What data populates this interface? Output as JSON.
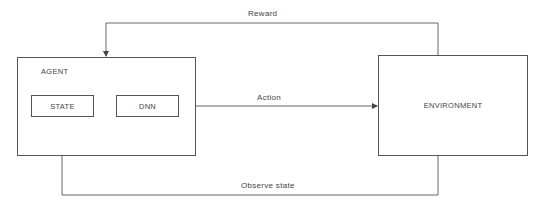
{
  "diagram": {
    "nodes": {
      "agent": {
        "label": "AGENT"
      },
      "state": {
        "label": "STATE"
      },
      "dnn": {
        "label": "DNN"
      },
      "environment": {
        "label": "ENVIRONMENT"
      }
    },
    "edges": {
      "reward": {
        "label": "Reward",
        "from": "ENVIRONMENT",
        "to": "AGENT"
      },
      "action": {
        "label": "Action",
        "from": "AGENT",
        "to": "ENVIRONMENT"
      },
      "observe": {
        "label": "Observe state",
        "from": "ENVIRONMENT",
        "to": "STATE"
      },
      "state_to_dnn": {
        "label": "",
        "from": "STATE",
        "to": "DNN"
      }
    },
    "colors": {
      "line": "#555555",
      "text": "#444444",
      "background": "#ffffff"
    }
  }
}
